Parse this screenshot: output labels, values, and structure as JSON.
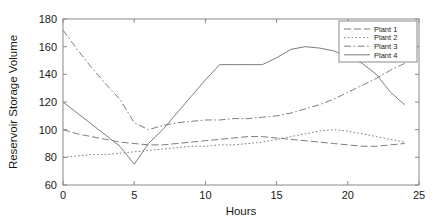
{
  "chart_data": {
    "type": "line",
    "title": "",
    "xlabel": "Hours",
    "ylabel": "Reservoir Storage Volume",
    "xlim": [
      0,
      25
    ],
    "ylim": [
      60,
      180
    ],
    "xticks": [
      0,
      5,
      10,
      15,
      20,
      25
    ],
    "yticks": [
      60,
      80,
      100,
      120,
      140,
      160,
      180
    ],
    "grid": false,
    "legend_position": "top-right",
    "x": [
      0,
      1,
      2,
      3,
      4,
      5,
      6,
      7,
      8,
      9,
      10,
      11,
      12,
      13,
      14,
      15,
      16,
      17,
      18,
      19,
      20,
      21,
      22,
      23,
      24
    ],
    "series": [
      {
        "name": "Plant 1",
        "style": "dashed",
        "values": [
          100,
          97,
          95,
          93,
          91,
          90,
          89,
          89,
          90,
          91,
          92,
          93,
          94,
          95,
          95,
          94,
          93,
          92,
          91,
          90,
          89,
          88,
          88,
          89,
          90
        ]
      },
      {
        "name": "Plant 2",
        "style": "dotted",
        "values": [
          80,
          81,
          82,
          82,
          83,
          84,
          85,
          86,
          87,
          88,
          88,
          89,
          89,
          90,
          91,
          93,
          95,
          97,
          99,
          100,
          99,
          97,
          95,
          93,
          91
        ]
      },
      {
        "name": "Plant 3",
        "style": "dashdot",
        "values": [
          172,
          158,
          145,
          133,
          122,
          105,
          100,
          103,
          105,
          106,
          107,
          107,
          108,
          108,
          109,
          110,
          112,
          115,
          118,
          122,
          127,
          132,
          137,
          143,
          148
        ]
      },
      {
        "name": "Plant 4",
        "style": "solid",
        "values": [
          120,
          112,
          104,
          96,
          88,
          75,
          90,
          100,
          112,
          124,
          136,
          147,
          147,
          147,
          147,
          152,
          158,
          160,
          159,
          157,
          153,
          148,
          140,
          127,
          118
        ]
      }
    ]
  },
  "legend": {
    "entries": [
      "Plant 1",
      "Plant 2",
      "Plant 3",
      "Plant 4"
    ]
  },
  "axes": {
    "ylabel": "Reservoir Storage Volume",
    "xlabel": "Hours",
    "xtick_labels": [
      "0",
      "5",
      "10",
      "15",
      "20",
      "25"
    ],
    "ytick_labels": [
      "60",
      "80",
      "100",
      "120",
      "140",
      "160",
      "180"
    ]
  },
  "colors": {
    "line": "#7d7d7d",
    "axis": "#8a8a8a",
    "text": "#1a1a1a",
    "background": "#ffffff"
  }
}
